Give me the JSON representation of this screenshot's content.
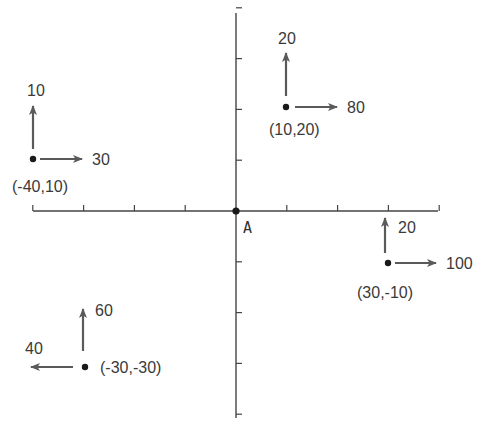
{
  "diagram": {
    "title": "",
    "origin_label": "A",
    "colors": {
      "axis": "#444444",
      "arrow": "#5a5a5a",
      "point": "#1a1a1a",
      "text": "#3a3a3a"
    },
    "grid_unit": 10,
    "x_ticks": [
      -40,
      -30,
      -20,
      -10,
      0,
      10,
      20,
      30,
      40
    ],
    "y_ticks": [
      40,
      30,
      20,
      10,
      0,
      -10,
      -20,
      -30,
      -40
    ],
    "points": [
      {
        "id": "p1",
        "coord_label": "(-40,10)",
        "x": -40,
        "y": 10,
        "up_label": "10",
        "up_value": 10,
        "horiz_label": "30",
        "horiz_value": 30,
        "horiz_dir": "right"
      },
      {
        "id": "p2",
        "coord_label": "(10,20)",
        "x": 10,
        "y": 20,
        "up_label": "20",
        "up_value": 20,
        "horiz_label": "80",
        "horiz_value": 80,
        "horiz_dir": "right"
      },
      {
        "id": "p3",
        "coord_label": "(30,-10)",
        "x": 30,
        "y": -10,
        "up_label": "20",
        "up_value": 20,
        "horiz_label": "100",
        "horiz_value": 100,
        "horiz_dir": "right"
      },
      {
        "id": "p4",
        "coord_label": "(-30,-30)",
        "x": -30,
        "y": -30,
        "up_label": "60",
        "up_value": 60,
        "horiz_label": "40",
        "horiz_value": 40,
        "horiz_dir": "left"
      }
    ]
  }
}
